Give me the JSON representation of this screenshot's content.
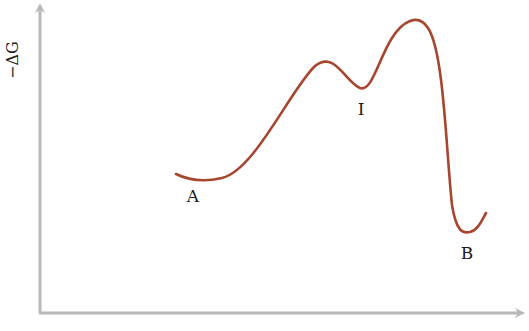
{
  "diagram": {
    "type": "energy-profile",
    "y_axis_label": "−ΔG",
    "x_axis_label": "",
    "colors": {
      "curve": "#a8452f",
      "axes": "#b8b8b8",
      "text": "#1a1a1a"
    },
    "points": [
      {
        "label": "A",
        "description": "starting state minimum"
      },
      {
        "label": "I",
        "description": "intermediate minimum"
      },
      {
        "label": "B",
        "description": "final state minimum"
      }
    ]
  }
}
